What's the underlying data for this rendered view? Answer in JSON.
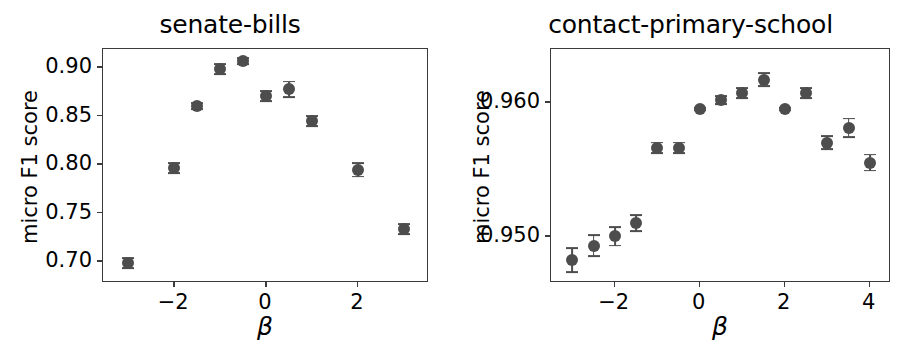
{
  "figure": {
    "background": "#ffffff",
    "marker_color": "#4d4d4d",
    "axis_color": "#3a3a3a"
  },
  "chart_data": [
    {
      "type": "scatter",
      "title": "senate-bills",
      "xlabel": "β",
      "ylabel": "micro F1 score",
      "grid": false,
      "legend": false,
      "xlim": [
        -3.55,
        3.55
      ],
      "ylim": [
        0.6775,
        0.9185
      ],
      "xticks": [
        -2,
        0,
        2
      ],
      "xtick_labels": [
        "−2",
        "0",
        "2"
      ],
      "yticks": [
        0.7,
        0.75,
        0.8,
        0.85,
        0.9
      ],
      "ytick_labels": [
        "0.70",
        "0.75",
        "0.80",
        "0.85",
        "0.90"
      ],
      "x": [
        -3,
        -2,
        -1.5,
        -1,
        -0.5,
        0,
        0.5,
        1,
        2,
        3
      ],
      "y": [
        0.698,
        0.796,
        0.86,
        0.898,
        0.906,
        0.87,
        0.877,
        0.844,
        0.794,
        0.733
      ],
      "yerr": [
        0.005,
        0.005,
        0.003,
        0.005,
        0.003,
        0.005,
        0.008,
        0.005,
        0.007,
        0.005
      ]
    },
    {
      "type": "scatter",
      "title": "contact-primary-school",
      "xlabel": "β",
      "ylabel": "micro F1 score",
      "grid": false,
      "legend": false,
      "xlim": [
        -3.5,
        4.5
      ],
      "ylim": [
        0.9465,
        0.964
      ],
      "xticks": [
        -2,
        0,
        2,
        4
      ],
      "xtick_labels": [
        "−2",
        "0",
        "2",
        "4"
      ],
      "yticks": [
        0.95,
        0.96
      ],
      "ytick_labels": [
        "0.950",
        "0.960"
      ],
      "x": [
        -3,
        -2.5,
        -2,
        -1.5,
        -1,
        -0.5,
        0,
        0.5,
        1,
        1.5,
        2,
        2.5,
        3,
        3.5,
        4
      ],
      "y": [
        0.9482,
        0.9493,
        0.95,
        0.951,
        0.9566,
        0.9566,
        0.9595,
        0.9602,
        0.9607,
        0.9617,
        0.9595,
        0.9607,
        0.957,
        0.9581,
        0.9555
      ],
      "yerr": [
        0.0009,
        0.0008,
        0.0007,
        0.0006,
        0.0004,
        0.0004,
        0.0001,
        0.0003,
        0.0004,
        0.0005,
        0.0001,
        0.0004,
        0.0005,
        0.0007,
        0.0006
      ]
    }
  ],
  "panels": [
    {
      "name": "senate-bills",
      "title": "senate-bills",
      "ylabel": "micro F1 score",
      "xlabel": "β"
    },
    {
      "name": "contact-primary-school",
      "title": "contact-primary-school",
      "ylabel": "micro F1 score",
      "xlabel": "β"
    }
  ]
}
